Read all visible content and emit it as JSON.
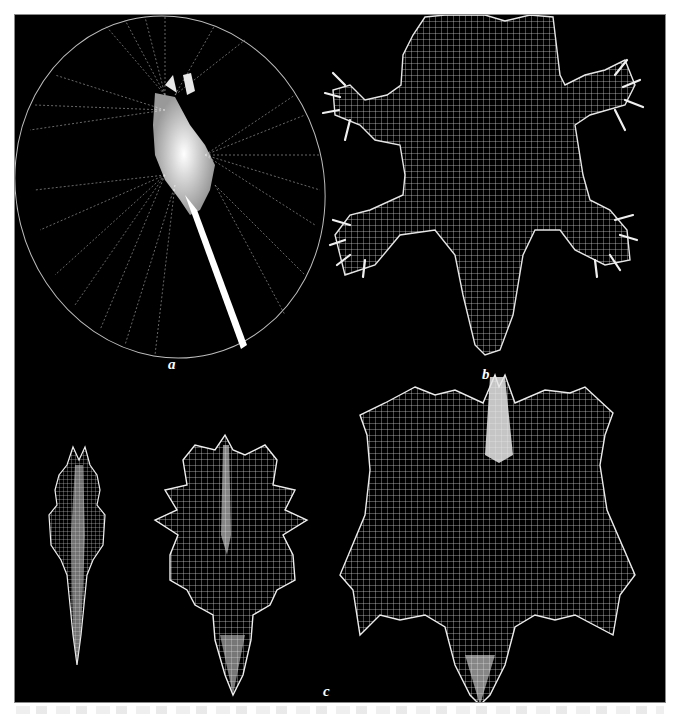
{
  "figure": {
    "background": "#000000",
    "mesh_color": "#ffffff",
    "panels": [
      {
        "id": "a",
        "label": "a",
        "description": "radial wireframe disc with elongated body"
      },
      {
        "id": "b",
        "label": "b",
        "description": "symmetric mesh surfaces with limb-like protrusions"
      },
      {
        "id": "c",
        "label": "c",
        "description": "narrow elongated mesh and spiky leaf-like mesh"
      }
    ]
  }
}
